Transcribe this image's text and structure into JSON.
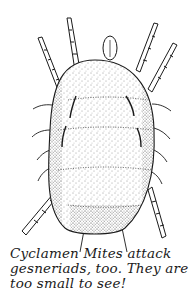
{
  "illustration": {
    "subject": "cyclamen mite",
    "ink_color": "#1a1a1a",
    "background": "#ffffff"
  },
  "caption": {
    "lines": [
      "Cyclamen Mites attack",
      "gesneriads, too. They are",
      "too small to see!"
    ]
  }
}
